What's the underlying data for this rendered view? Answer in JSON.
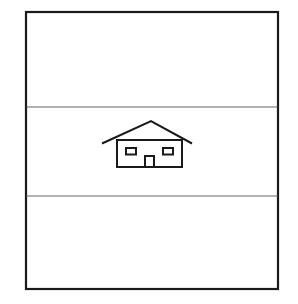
{
  "diagram": {
    "stroke_color": "#1a1a1a",
    "background_color": "#ffffff",
    "frame": {
      "x": 26,
      "y": 12,
      "width": 252,
      "height": 277
    },
    "dividers": [
      107,
      196
    ],
    "bands": [
      {
        "name": "top-band",
        "content": ""
      },
      {
        "name": "middle-band",
        "content": "house-icon"
      },
      {
        "name": "bottom-band",
        "content": ""
      }
    ],
    "icon": "house-icon"
  }
}
